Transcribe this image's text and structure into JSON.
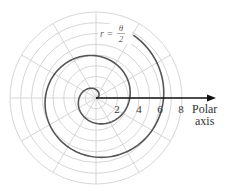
{
  "chart_data": {
    "type": "line",
    "subtype": "polar",
    "title": "",
    "equation": "r = θ/2",
    "curve_label": {
      "lhs": "r =",
      "numerator": "θ",
      "denominator": "2"
    },
    "axis_label": [
      "Polar",
      "axis"
    ],
    "tick_labels": [
      "2",
      "4",
      "6",
      "8"
    ],
    "tick_values": [
      2,
      4,
      6,
      8
    ],
    "r_max": 8,
    "grid_circles": [
      1,
      2,
      3,
      4,
      5,
      6,
      7,
      8
    ],
    "spoke_angle_step_deg": 30,
    "theta_range": [
      0,
      13.6
    ],
    "grid": true,
    "series": [
      {
        "name": "r = θ/2",
        "theta_start": 0,
        "theta_end": 13.6,
        "r_coefficient": 0.5
      }
    ],
    "axis_crossings": [
      {
        "theta": 6.283,
        "r": 3.14
      },
      {
        "theta": 12.566,
        "r": 6.28
      }
    ],
    "colors": {
      "grid": "#d6d6d6",
      "curve": "#555555",
      "axis": "#111111"
    }
  }
}
